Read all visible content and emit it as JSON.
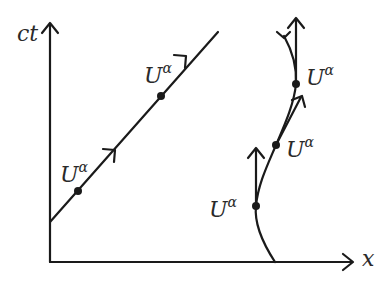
{
  "diagram": {
    "type": "spacetime-diagram",
    "axes": {
      "vertical_label": "ct",
      "horizontal_label": "x"
    },
    "worldlines": [
      {
        "name": "straight-worldline",
        "description": "inertial observer, straight line",
        "events": [
          {
            "label": "U",
            "superscript": "α"
          },
          {
            "label": "U",
            "superscript": "α"
          }
        ]
      },
      {
        "name": "curved-worldline",
        "description": "accelerated observer, curved line with tangent four-velocity vectors",
        "events": [
          {
            "label": "U",
            "superscript": "α"
          },
          {
            "label": "U",
            "superscript": "α"
          },
          {
            "label": "U",
            "superscript": "α"
          }
        ]
      }
    ],
    "colors": {
      "ink": "#1a1a1a",
      "background": "#ffffff"
    }
  }
}
